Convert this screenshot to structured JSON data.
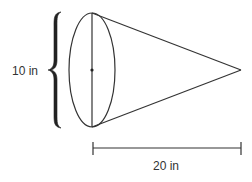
{
  "figure": {
    "shape": "cone",
    "diameter_label": "10 in",
    "height_label": "20 in",
    "stroke_color": "#333333",
    "background": "#ffffff"
  }
}
